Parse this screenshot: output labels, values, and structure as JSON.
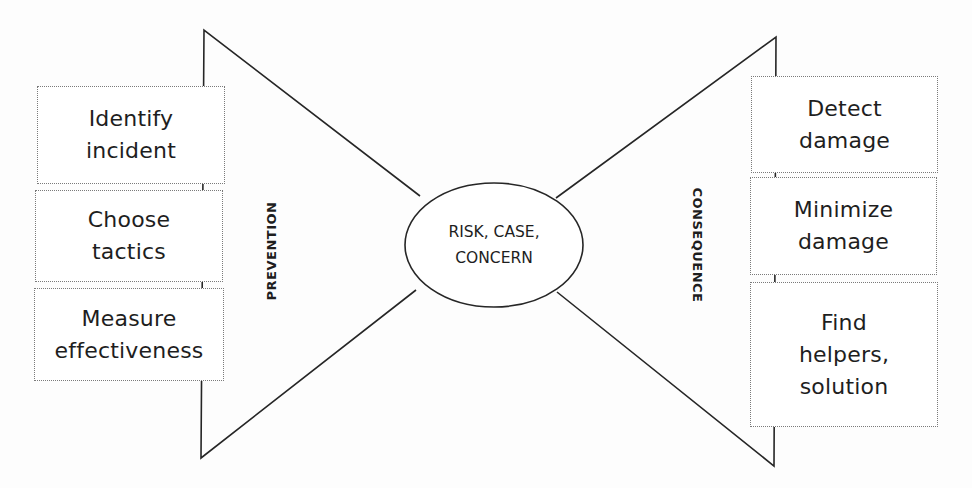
{
  "diagram": {
    "type": "bow-tie",
    "center": {
      "label": "RISK, CASE,\nCONCERN"
    },
    "left": {
      "section_label": "PREVENTION",
      "boxes": [
        {
          "label": "Identify\nincident"
        },
        {
          "label": "Choose\ntactics"
        },
        {
          "label": "Measure\neffectiveness"
        }
      ]
    },
    "right": {
      "section_label": "CONSEQUENCE",
      "boxes": [
        {
          "label": "Detect\ndamage"
        },
        {
          "label": "Minimize\ndamage"
        },
        {
          "label": "Find\nhelpers,\nsolution"
        }
      ]
    },
    "colors": {
      "line": "#262626",
      "box_border": "#7a7a7a",
      "text": "#1e1e1e",
      "background": "#fdfdfd"
    }
  }
}
